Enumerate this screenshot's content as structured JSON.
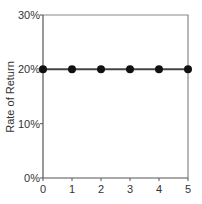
{
  "chart_data": {
    "type": "line",
    "title": "",
    "xlabel": "",
    "ylabel": "Rate of Return",
    "x": [
      0,
      1,
      2,
      3,
      4,
      5
    ],
    "series": [
      {
        "name": "Rate of Return",
        "values": [
          20,
          20,
          20,
          20,
          20,
          20
        ]
      }
    ],
    "xlim": [
      0,
      5
    ],
    "ylim": [
      0,
      30
    ],
    "x_ticks": [
      "0",
      "1",
      "2",
      "3",
      "4",
      "5"
    ],
    "y_ticks": [
      "0%",
      "10%",
      "20%",
      "30%"
    ],
    "y_tick_values": [
      0,
      10,
      20,
      30
    ],
    "grid": false,
    "legend": null,
    "markers": "filled-circle",
    "colors": {
      "line": "#444444",
      "marker": "#111111",
      "frame": "#888888",
      "axis": "#555555"
    }
  }
}
